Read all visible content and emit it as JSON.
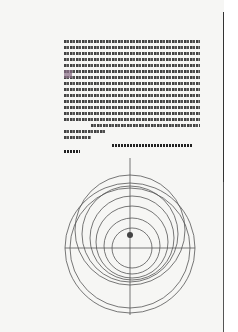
{
  "page": {
    "type": "manuscript-scan",
    "content": "astronomical text with planetary orbit diagram",
    "text_block": {
      "lines": 17
    },
    "diagram": {
      "label": "concentric orbit diagram"
    },
    "marginal_note": ""
  }
}
